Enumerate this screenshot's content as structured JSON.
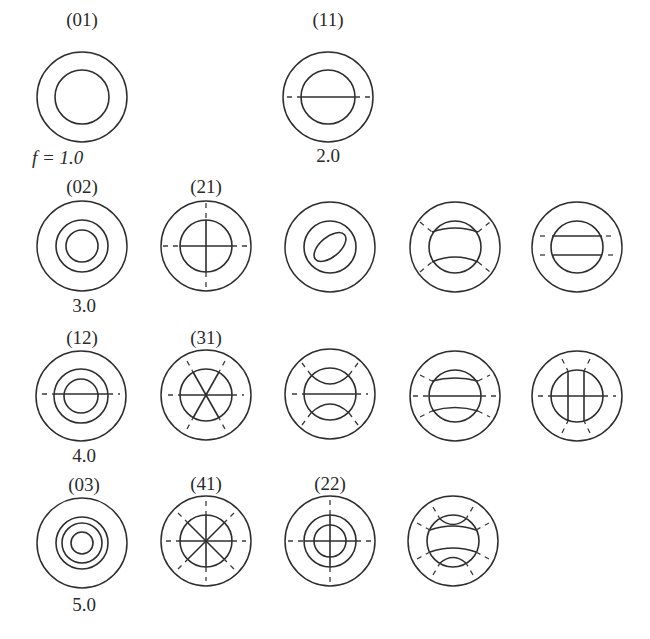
{
  "figure": {
    "frequency_prefix": "f = ",
    "modes": [
      {
        "id": "m01",
        "label": "(01)",
        "freq": "1.0",
        "row": 1,
        "col": 1
      },
      {
        "id": "m11",
        "label": "(11)",
        "freq": "2.0",
        "row": 1,
        "col": 3
      },
      {
        "id": "m02",
        "label": "(02)",
        "freq": "3.0",
        "row": 2,
        "col": 1
      },
      {
        "id": "m21",
        "label": "(21)",
        "freq": "",
        "row": 2,
        "col": 2
      },
      {
        "id": "r2c3",
        "label": "",
        "freq": "",
        "row": 2,
        "col": 3
      },
      {
        "id": "r2c4",
        "label": "",
        "freq": "",
        "row": 2,
        "col": 4
      },
      {
        "id": "r2c5",
        "label": "",
        "freq": "",
        "row": 2,
        "col": 5
      },
      {
        "id": "m12",
        "label": "(12)",
        "freq": "4.0",
        "row": 3,
        "col": 1
      },
      {
        "id": "m31",
        "label": "(31)",
        "freq": "",
        "row": 3,
        "col": 2
      },
      {
        "id": "r3c3",
        "label": "",
        "freq": "",
        "row": 3,
        "col": 3
      },
      {
        "id": "r3c4",
        "label": "",
        "freq": "",
        "row": 3,
        "col": 4
      },
      {
        "id": "r3c5",
        "label": "",
        "freq": "",
        "row": 3,
        "col": 5
      },
      {
        "id": "m03",
        "label": "(03)",
        "freq": "5.0",
        "row": 4,
        "col": 1
      },
      {
        "id": "m41",
        "label": "(41)",
        "freq": "",
        "row": 4,
        "col": 2
      },
      {
        "id": "m22",
        "label": "(22)",
        "freq": "",
        "row": 4,
        "col": 3
      },
      {
        "id": "r4c4",
        "label": "",
        "freq": "",
        "row": 4,
        "col": 4
      }
    ],
    "labels": {
      "m01": "(01)",
      "m11": "(11)",
      "m02": "(02)",
      "m21": "(21)",
      "m12": "(12)",
      "m31": "(31)",
      "m03": "(03)",
      "m41": "(41)",
      "m22": "(22)"
    },
    "freqs": {
      "f1": "f = 1.0",
      "f2": "2.0",
      "f3": "3.0",
      "f4": "4.0",
      "f5": "5.0"
    }
  }
}
